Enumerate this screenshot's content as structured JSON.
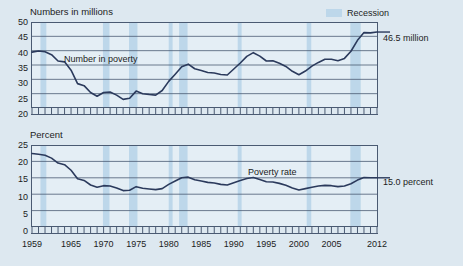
{
  "figure": {
    "background_color": "#dde8f0",
    "line_color": "#2b3a5c",
    "recession_color": "#bdd7ea",
    "axis_color": "#4a5a72",
    "grid_color": "#4a5a72"
  },
  "legend": {
    "recession_label": "Recession",
    "swatch_color": "#bdd7ea"
  },
  "panels": [
    {
      "id": "number-in-poverty",
      "axis_title": "Numbers in millions",
      "series_label": "Number in poverty",
      "end_annotation": "46.5 million",
      "y_ticks": [
        "50",
        "45",
        "40",
        "35",
        "30",
        "25",
        "20"
      ]
    },
    {
      "id": "poverty-rate",
      "axis_title": "Percent",
      "series_label": "Poverty rate",
      "end_annotation": "15.0 percent",
      "y_ticks": [
        "25",
        "20",
        "15",
        "10",
        "5",
        "0"
      ]
    }
  ],
  "x_ticks": [
    "1959",
    "1965",
    "1970",
    "1975",
    "1980",
    "1985",
    "1990",
    "1995",
    "2000",
    "2005",
    "2012"
  ],
  "chart_data": {
    "type": "line",
    "xlabel": "",
    "x": [
      1959,
      1960,
      1961,
      1962,
      1963,
      1964,
      1965,
      1966,
      1967,
      1968,
      1969,
      1970,
      1971,
      1972,
      1973,
      1974,
      1975,
      1976,
      1977,
      1978,
      1979,
      1980,
      1981,
      1982,
      1983,
      1984,
      1985,
      1986,
      1987,
      1988,
      1989,
      1990,
      1991,
      1992,
      1993,
      1994,
      1995,
      1996,
      1997,
      1998,
      1999,
      2000,
      2001,
      2002,
      2003,
      2004,
      2005,
      2006,
      2007,
      2008,
      2009,
      2010,
      2011,
      2012
    ],
    "grid": true,
    "legend_position": "top-right",
    "recessions": [
      {
        "start": 1960.3,
        "end": 1961.2
      },
      {
        "start": 1969.9,
        "end": 1970.9
      },
      {
        "start": 1973.9,
        "end": 1975.2
      },
      {
        "start": 1980.0,
        "end": 1980.6
      },
      {
        "start": 1981.6,
        "end": 1982.9
      },
      {
        "start": 1990.6,
        "end": 1991.2
      },
      {
        "start": 2001.2,
        "end": 2001.9
      },
      {
        "start": 2007.9,
        "end": 2009.5
      }
    ],
    "series": [
      {
        "name": "Number in poverty",
        "unit": "millions",
        "ylabel": "Numbers in millions",
        "ylim": [
          20,
          50
        ],
        "yticks": [
          20,
          25,
          30,
          35,
          40,
          45,
          50
        ],
        "end_value": 46.5,
        "end_label": "46.5 million",
        "values": [
          39.5,
          39.9,
          39.6,
          38.6,
          36.4,
          36.1,
          33.2,
          28.5,
          27.8,
          25.4,
          24.1,
          25.4,
          25.6,
          24.5,
          23.0,
          23.4,
          25.9,
          25.0,
          24.7,
          24.5,
          26.1,
          29.3,
          31.8,
          34.4,
          35.3,
          33.7,
          33.1,
          32.4,
          32.2,
          31.7,
          31.5,
          33.6,
          35.7,
          38.0,
          39.3,
          38.1,
          36.4,
          36.5,
          35.6,
          34.5,
          32.8,
          31.6,
          32.9,
          34.6,
          35.9,
          37.0,
          37.0,
          36.5,
          37.3,
          39.8,
          43.6,
          46.3,
          46.2,
          46.5
        ]
      },
      {
        "name": "Poverty rate",
        "unit": "percent",
        "ylabel": "Percent",
        "ylim": [
          0,
          25
        ],
        "yticks": [
          0,
          5,
          10,
          15,
          20,
          25
        ],
        "end_value": 15.0,
        "end_label": "15.0 percent",
        "values": [
          22.4,
          22.2,
          21.9,
          21.0,
          19.5,
          19.0,
          17.3,
          14.7,
          14.2,
          12.8,
          12.1,
          12.6,
          12.5,
          11.9,
          11.1,
          11.2,
          12.3,
          11.8,
          11.6,
          11.4,
          11.7,
          13.0,
          14.0,
          15.0,
          15.2,
          14.4,
          14.0,
          13.6,
          13.4,
          13.0,
          12.8,
          13.5,
          14.2,
          14.8,
          15.1,
          14.5,
          13.8,
          13.7,
          13.3,
          12.7,
          11.9,
          11.3,
          11.7,
          12.1,
          12.5,
          12.7,
          12.6,
          12.3,
          12.5,
          13.2,
          14.3,
          15.1,
          15.0,
          15.0
        ]
      }
    ]
  }
}
